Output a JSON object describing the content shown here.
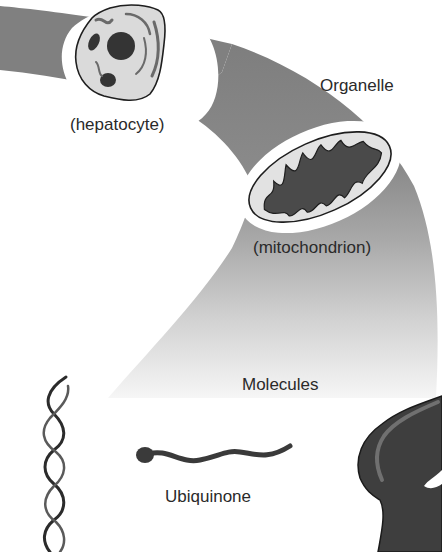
{
  "diagram": {
    "type": "scale-of-biological-organization",
    "levels": [
      {
        "level": "Cell",
        "example_label": "(hepatocyte)"
      },
      {
        "level": "Organelle",
        "level_label": "Organelle",
        "example_label": "(mitochondrion)"
      },
      {
        "level": "Molecules",
        "level_label": "Molecules",
        "examples": [
          "Ubiquinone",
          "DNA double helix",
          "Protein"
        ]
      }
    ]
  },
  "labels": {
    "hepatocyte": "(hepatocyte)",
    "organelle": "Organelle",
    "mitochondrion": "(mitochondrion)",
    "molecules": "Molecules",
    "ubiquinone": "Ubiquinone"
  },
  "colors": {
    "band_dark": "#7a7a7a",
    "band_light": "#f4f4f4",
    "cell_fill": "#dcdcdc",
    "organelle_fill": "#e2e2e2",
    "dark_structure": "#333333",
    "outline": "#1e1e1e",
    "text": "#2a2a2a"
  }
}
